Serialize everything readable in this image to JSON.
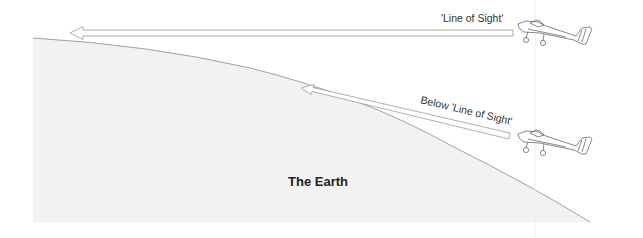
{
  "diagram": {
    "type": "line-of-sight-illustration",
    "labels": {
      "line_of_sight": "'Line of Sight'",
      "below_line_of_sight": "Below 'Line of Sight'",
      "earth": "The Earth"
    },
    "elements": {
      "earth": {
        "shape": "curved-horizon",
        "fill": "#f2f2f2",
        "stroke": "#8a8a8a"
      },
      "arrows": [
        {
          "id": "line-of-sight-arrow",
          "direction": "left",
          "from": [
            513,
            33
          ],
          "to": [
            70,
            33
          ]
        },
        {
          "id": "below-line-of-sight-arrow",
          "direction": "left-up",
          "from": [
            510,
            136
          ],
          "to": [
            301,
            88
          ]
        }
      ],
      "aircraft": [
        {
          "id": "upper-aircraft",
          "position": [
            515,
            15
          ]
        },
        {
          "id": "lower-aircraft",
          "position": [
            515,
            125
          ]
        }
      ]
    },
    "colors": {
      "line": "#8a8a8a",
      "earth_fill": "#f2f2f2",
      "text": "#333333",
      "background": "#ffffff"
    }
  }
}
